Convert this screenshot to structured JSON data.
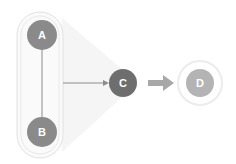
{
  "diagram": {
    "type": "flow-diagram",
    "group": {
      "label": "",
      "members": [
        "A",
        "B"
      ]
    },
    "nodes": [
      {
        "id": "A",
        "label": "A",
        "color": "#8a8a8a"
      },
      {
        "id": "B",
        "label": "B",
        "color": "#8a8a8a"
      },
      {
        "id": "C",
        "label": "C",
        "color": "#6e6e6e"
      },
      {
        "id": "D",
        "label": "D",
        "color": "#b4b4b4"
      }
    ],
    "edges": [
      {
        "from": "A",
        "to": "B",
        "style": "line"
      },
      {
        "from": "group(A,B)",
        "to": "C",
        "style": "thin-arrow"
      },
      {
        "from": "C",
        "to": "D",
        "style": "thick-arrow"
      }
    ],
    "colors": {
      "group_outline": "#dcdcdc",
      "edge": "#8c8c8c",
      "thick_arrow": "#a8a8a8",
      "wedge": "#f4f4f4",
      "halo": "#eeeeee"
    }
  }
}
